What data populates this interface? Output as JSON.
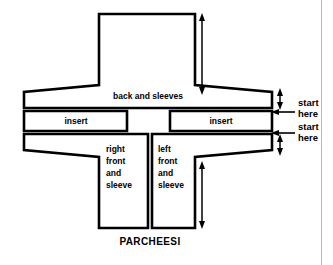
{
  "diagram": {
    "title": "PARCHEESI",
    "pieces": [
      {
        "id": "back-and-sleeves",
        "label": "back and sleeves",
        "label_lines": [
          "back and sleeves"
        ]
      },
      {
        "id": "insert-left",
        "label": "insert",
        "label_lines": [
          "insert"
        ]
      },
      {
        "id": "insert-right",
        "label": "insert",
        "label_lines": [
          "insert"
        ]
      },
      {
        "id": "right-front-and-sleeve",
        "label": "right front and sleeve",
        "label_lines": [
          "right",
          "front",
          "and",
          "sleeve"
        ]
      },
      {
        "id": "left-front-and-sleeve",
        "label": "left front and sleeve",
        "label_lines": [
          "left",
          "front",
          "and",
          "sleeve"
        ]
      }
    ],
    "annotations": [
      {
        "id": "start-here-upper",
        "lines": [
          "start",
          "here"
        ]
      },
      {
        "id": "start-here-lower",
        "lines": [
          "start",
          "here"
        ]
      }
    ],
    "colors": {
      "outline": "#000000",
      "fill": "#ffffff",
      "border": "#b9b9b9"
    }
  }
}
